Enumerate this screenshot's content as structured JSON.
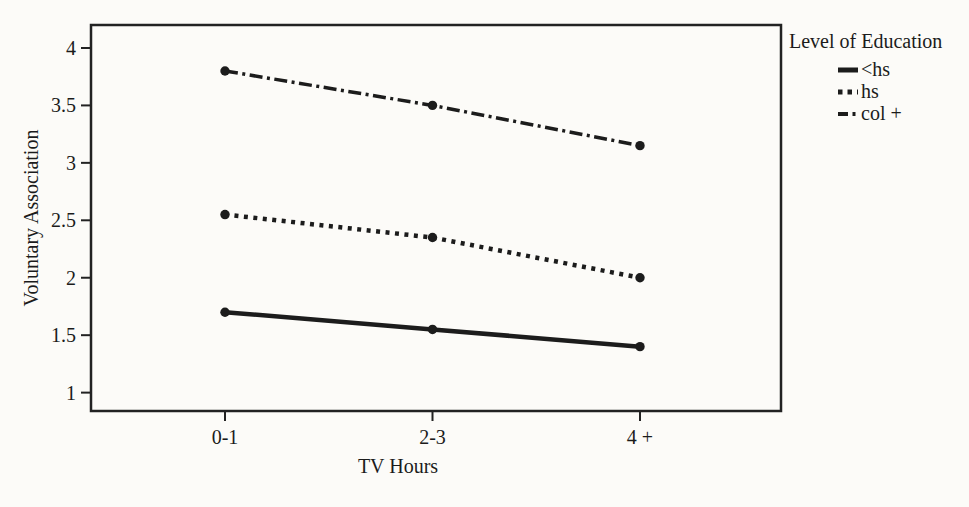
{
  "figure": {
    "background_color": "#fcfbf8",
    "ink_color": "#1c1c1c"
  },
  "chart_data": {
    "type": "line",
    "title": "",
    "xlabel": "TV Hours",
    "ylabel": "Voluntary Association",
    "categories": [
      "0-1",
      "2-3",
      "4 +"
    ],
    "yticks": [
      4,
      3.5,
      3,
      2.5,
      2,
      1.5,
      1
    ],
    "ylim": [
      0.84,
      4.2
    ],
    "grid": false,
    "legend_title": "Level of Education",
    "legend_position": "right",
    "marker": "filled-circle",
    "line_color": "#1c1c1c",
    "series": [
      {
        "name": "<hs",
        "values": [
          1.7,
          1.55,
          1.4
        ],
        "style": "solid"
      },
      {
        "name": "hs",
        "values": [
          2.55,
          2.35,
          2.0
        ],
        "style": "dotted"
      },
      {
        "name": "col +",
        "values": [
          3.8,
          3.5,
          3.15
        ],
        "style": "dashdot"
      }
    ]
  }
}
